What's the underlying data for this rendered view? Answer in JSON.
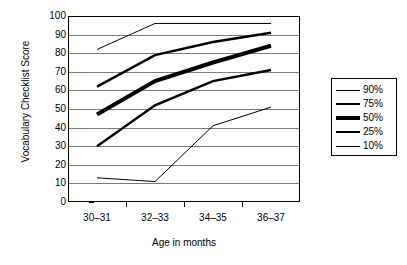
{
  "chart_data": {
    "type": "line",
    "title": "",
    "subtitle": "",
    "xlabel": "Age in months",
    "ylabel": "Vocabulary Checklist Score",
    "categories": [
      "30–31",
      "32–33",
      "34–35",
      "36–37"
    ],
    "ylim": [
      0,
      100
    ],
    "yticks": [
      0,
      10,
      20,
      30,
      40,
      50,
      60,
      70,
      80,
      90,
      100
    ],
    "ytick_labels": [
      "0",
      "10",
      "20",
      "30",
      "40",
      "50",
      "60",
      "70",
      "80",
      "90",
      "100"
    ],
    "grid": true,
    "grid_axis": "y",
    "legend_position": "right",
    "series": [
      {
        "name": "90%",
        "values": [
          82,
          96,
          96,
          96
        ],
        "line_width": 1,
        "color": "#000000"
      },
      {
        "name": "75%",
        "values": [
          62,
          79,
          86,
          91
        ],
        "line_width": 2.5,
        "color": "#000000"
      },
      {
        "name": "50%",
        "values": [
          47,
          65,
          75,
          84
        ],
        "line_width": 4,
        "color": "#000000"
      },
      {
        "name": "25%",
        "values": [
          30,
          52,
          65,
          71
        ],
        "line_width": 2.5,
        "color": "#000000"
      },
      {
        "name": "10%",
        "values": [
          13,
          11,
          41,
          51
        ],
        "line_width": 1,
        "color": "#000000"
      }
    ]
  },
  "legend": {
    "items": [
      {
        "label": "90%"
      },
      {
        "label": "75%"
      },
      {
        "label": "50%"
      },
      {
        "label": "25%"
      },
      {
        "label": "10%"
      }
    ]
  }
}
